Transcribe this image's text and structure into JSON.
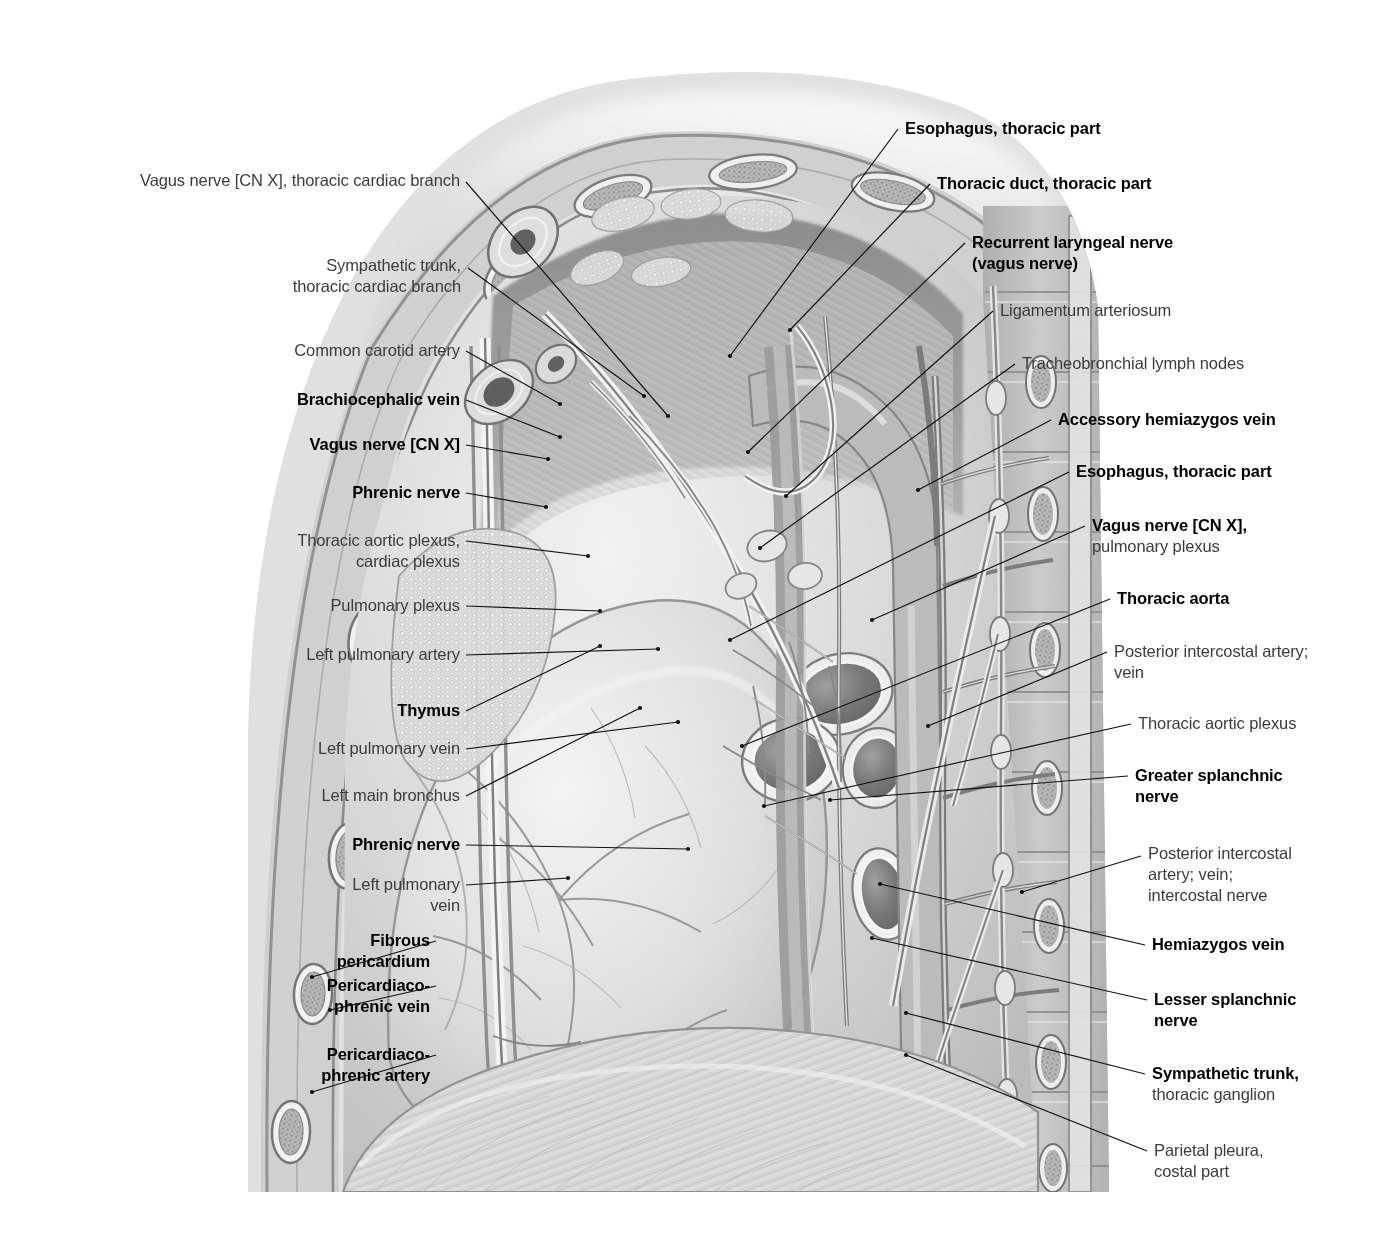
{
  "plate": {
    "title": "Thorax — left mediastinal wall, parasagittal dissection (left lateral view)",
    "illustration_style": "grayscale pencil / halftone anatomical engraving",
    "ink_color": "#111111",
    "plain_label_color": "#3c3c3c",
    "bold_label_color": "#000000",
    "background_color": "#ffffff"
  },
  "labels_left": [
    {
      "id": "vagus-cardiac-branch",
      "bold": false,
      "text": "Vagus nerve [CN X], thoracic cardiac branch",
      "x": 120,
      "y": 170,
      "w": 340,
      "leader": {
        "x1": 466,
        "y1": 182,
        "x2": 668,
        "y2": 416
      }
    },
    {
      "id": "sympathetic-trunk-cardiac-branch",
      "bold": false,
      "text": "Sympathetic trunk,\nthoracic cardiac branch",
      "x": 243,
      "y": 255,
      "w": 218,
      "leader": {
        "x1": 468,
        "y1": 268,
        "x2": 644,
        "y2": 396
      }
    },
    {
      "id": "common-carotid-artery",
      "bold": false,
      "text": "Common carotid artery",
      "x": 202,
      "y": 340,
      "w": 258,
      "leader": {
        "x1": 466,
        "y1": 351,
        "x2": 560,
        "y2": 404
      }
    },
    {
      "id": "brachiocephalic-vein",
      "bold": true,
      "text": "Brachiocephalic vein",
      "x": 176,
      "y": 389,
      "w": 284,
      "leader": {
        "x1": 466,
        "y1": 400,
        "x2": 560,
        "y2": 437
      }
    },
    {
      "id": "vagus-nerve-cnx-left",
      "bold": true,
      "text": "Vagus nerve [CN X]",
      "x": 166,
      "y": 434,
      "w": 294,
      "leader": {
        "x1": 466,
        "y1": 445,
        "x2": 548,
        "y2": 459
      }
    },
    {
      "id": "phrenic-nerve-upper",
      "bold": true,
      "text": "Phrenic nerve",
      "x": 180,
      "y": 482,
      "w": 280,
      "leader": {
        "x1": 466,
        "y1": 493,
        "x2": 546,
        "y2": 507
      }
    },
    {
      "id": "thoracic-aortic-plexus-cardiac-plexus",
      "bold": false,
      "text": "Thoracic aortic plexus,\ncardiac plexus",
      "x": 105,
      "y": 530,
      "w": 355,
      "leader": {
        "x1": 466,
        "y1": 541,
        "x2": 588,
        "y2": 556
      }
    },
    {
      "id": "pulmonary-plexus-left",
      "bold": false,
      "text": "Pulmonary plexus",
      "x": 113,
      "y": 595,
      "w": 347,
      "leader": {
        "x1": 466,
        "y1": 606,
        "x2": 600,
        "y2": 611
      }
    },
    {
      "id": "left-pulmonary-artery",
      "bold": false,
      "text": "Left pulmonary artery",
      "x": 70,
      "y": 644,
      "w": 390,
      "leader": {
        "x1": 466,
        "y1": 655,
        "x2": 658,
        "y2": 649
      }
    },
    {
      "id": "thymus",
      "bold": true,
      "text": "Thymus",
      "x": 128,
      "y": 700,
      "w": 332,
      "leader": {
        "x1": 466,
        "y1": 711,
        "x2": 600,
        "y2": 646
      }
    },
    {
      "id": "left-pulmonary-vein-upper",
      "bold": false,
      "text": "Left pulmonary vein",
      "x": 68,
      "y": 738,
      "w": 392,
      "leader": {
        "x1": 466,
        "y1": 749,
        "x2": 678,
        "y2": 722
      }
    },
    {
      "id": "left-main-bronchus",
      "bold": false,
      "text": "Left main bronchus",
      "x": 58,
      "y": 785,
      "w": 402,
      "leader": {
        "x1": 466,
        "y1": 796,
        "x2": 640,
        "y2": 708
      }
    },
    {
      "id": "phrenic-nerve-lower",
      "bold": true,
      "text": "Phrenic nerve",
      "x": 80,
      "y": 834,
      "w": 380,
      "leader": {
        "x1": 466,
        "y1": 845,
        "x2": 688,
        "y2": 849
      }
    },
    {
      "id": "left-pulmonary-vein-lower",
      "bold": false,
      "text": "Left pulmonary\nvein",
      "x": 78,
      "y": 874,
      "w": 382,
      "leader": {
        "x1": 466,
        "y1": 885,
        "x2": 568,
        "y2": 878
      }
    },
    {
      "id": "fibrous-pericardium",
      "bold": true,
      "text": "Fibrous\npericardium",
      "x": 90,
      "y": 930,
      "w": 340,
      "leader": {
        "x1": 436,
        "y1": 941,
        "x2": 312,
        "y2": 977
      }
    },
    {
      "id": "pericardiacophrenic-vein",
      "bold": true,
      "text": "Pericardiaco-\nphrenic vein",
      "x": 68,
      "y": 975,
      "w": 362,
      "leader": {
        "x1": 436,
        "y1": 986,
        "x2": 330,
        "y2": 1010
      }
    },
    {
      "id": "pericardiacophrenic-artery",
      "bold": true,
      "text": "Pericardiaco-\nphrenic artery",
      "x": 64,
      "y": 1044,
      "w": 366,
      "leader": {
        "x1": 436,
        "y1": 1055,
        "x2": 312,
        "y2": 1092
      }
    }
  ],
  "labels_right": [
    {
      "id": "esophagus-thoracic-part-upper",
      "bold": true,
      "text": "Esophagus, thoracic part",
      "x": 905,
      "y": 118,
      "w": 350,
      "leader": {
        "x1": 898,
        "y1": 129,
        "x2": 730,
        "y2": 356
      }
    },
    {
      "id": "thoracic-duct-thoracic-part",
      "bold": true,
      "text": "Thoracic duct, thoracic part",
      "x": 937,
      "y": 173,
      "w": 350,
      "leader": {
        "x1": 930,
        "y1": 184,
        "x2": 790,
        "y2": 330
      }
    },
    {
      "id": "recurrent-laryngeal-nerve",
      "bold": true,
      "text": "Recurrent laryngeal nerve\n(vagus nerve)",
      "x": 972,
      "y": 232,
      "w": 330,
      "leader": {
        "x1": 965,
        "y1": 243,
        "x2": 748,
        "y2": 452
      }
    },
    {
      "id": "ligamentum-arteriosum",
      "bold": false,
      "text": "Ligamentum arteriosum",
      "x": 1000,
      "y": 300,
      "w": 310,
      "leader": {
        "x1": 993,
        "y1": 311,
        "x2": 786,
        "y2": 496
      }
    },
    {
      "id": "tracheobronchial-lymph-nodes",
      "bold": false,
      "text": "Tracheobronchial lymph nodes",
      "x": 1022,
      "y": 353,
      "w": 300,
      "leader": {
        "x1": 1015,
        "y1": 364,
        "x2": 760,
        "y2": 548
      }
    },
    {
      "id": "accessory-hemiazygos-vein",
      "bold": true,
      "text": "Accessory hemiazygos vein",
      "x": 1058,
      "y": 409,
      "w": 300,
      "leader": {
        "x1": 1051,
        "y1": 420,
        "x2": 918,
        "y2": 490
      }
    },
    {
      "id": "esophagus-thoracic-part-lower",
      "bold": true,
      "text": "Esophagus, thoracic part",
      "x": 1076,
      "y": 461,
      "w": 300,
      "leader": {
        "x1": 1069,
        "y1": 472,
        "x2": 730,
        "y2": 640
      }
    },
    {
      "id": "vagus-nerve-pulmonary-plexus",
      "bold": true,
      "mixed": true,
      "head": "Vagus nerve [CN X],",
      "sub": "pulmonary plexus",
      "text": "Vagus nerve [CN X],\npulmonary plexus",
      "x": 1092,
      "y": 515,
      "w": 300,
      "leader": {
        "x1": 1085,
        "y1": 526,
        "x2": 872,
        "y2": 620
      }
    },
    {
      "id": "thoracic-aorta",
      "bold": true,
      "text": "Thoracic aorta",
      "x": 1117,
      "y": 588,
      "w": 300,
      "leader": {
        "x1": 1110,
        "y1": 599,
        "x2": 742,
        "y2": 746
      }
    },
    {
      "id": "posterior-intercostal-artery-vein",
      "bold": false,
      "text": "Posterior intercostal artery;\nvein",
      "x": 1114,
      "y": 641,
      "w": 300,
      "leader": {
        "x1": 1107,
        "y1": 652,
        "x2": 928,
        "y2": 726
      }
    },
    {
      "id": "thoracic-aortic-plexus-right",
      "bold": false,
      "text": "Thoracic aortic plexus",
      "x": 1138,
      "y": 713,
      "w": 300,
      "leader": {
        "x1": 1131,
        "y1": 724,
        "x2": 764,
        "y2": 806
      }
    },
    {
      "id": "greater-splanchnic-nerve",
      "bold": true,
      "text": "Greater splanchnic\nnerve",
      "x": 1135,
      "y": 765,
      "w": 300,
      "leader": {
        "x1": 1128,
        "y1": 776,
        "x2": 830,
        "y2": 800
      }
    },
    {
      "id": "posterior-intercostal-artery-vein-nerve",
      "bold": false,
      "text": "Posterior intercostal\nartery; vein;\nintercostal nerve",
      "x": 1148,
      "y": 843,
      "w": 300,
      "leader": {
        "x1": 1141,
        "y1": 856,
        "x2": 1022,
        "y2": 892
      }
    },
    {
      "id": "hemiazygos-vein",
      "bold": true,
      "text": "Hemiazygos vein",
      "x": 1152,
      "y": 934,
      "w": 300,
      "leader": {
        "x1": 1145,
        "y1": 945,
        "x2": 880,
        "y2": 884
      }
    },
    {
      "id": "lesser-splanchnic-nerve",
      "bold": true,
      "text": "Lesser splanchnic\nnerve",
      "x": 1154,
      "y": 989,
      "w": 300,
      "leader": {
        "x1": 1147,
        "y1": 1000,
        "x2": 872,
        "y2": 938
      }
    },
    {
      "id": "sympathetic-trunk-thoracic-ganglion",
      "bold": true,
      "mixed": true,
      "head": "Sympathetic trunk,",
      "sub": "thoracic ganglion",
      "text": "Sympathetic trunk,\nthoracic ganglion",
      "x": 1152,
      "y": 1063,
      "w": 300,
      "leader": {
        "x1": 1145,
        "y1": 1074,
        "x2": 906,
        "y2": 1013
      }
    },
    {
      "id": "parietal-pleura-costal-part",
      "bold": false,
      "text": "Parietal pleura,\ncostal part",
      "x": 1154,
      "y": 1140,
      "w": 300,
      "leader": {
        "x1": 1147,
        "y1": 1151,
        "x2": 906,
        "y2": 1055
      }
    }
  ]
}
